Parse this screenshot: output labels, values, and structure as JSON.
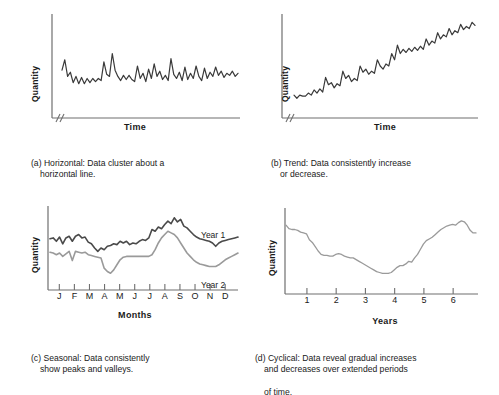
{
  "figure": {
    "background": "#ffffff",
    "ink_color": "#3a3a3a",
    "light_series_color": "#9a9a9a"
  },
  "panels": [
    {
      "key": "a",
      "tag": "(a)",
      "caption_line1": "(a) Horizontal: Data cluster about a",
      "caption_line2": "horizontal line.",
      "ylabel": "Quantity",
      "xlabel": "Time",
      "axis_break": true,
      "ticks": [],
      "series_labels": []
    },
    {
      "key": "b",
      "tag": "(b)",
      "caption_line1": "(b) Trend: Data consistently increase",
      "caption_line2": "or decrease.",
      "ylabel": "Quantity",
      "xlabel": "Time",
      "axis_break": true,
      "ticks": [],
      "series_labels": []
    },
    {
      "key": "c",
      "tag": "(c)",
      "caption_line1": "(c) Seasonal: Data consistently",
      "caption_line2": "show peaks and valleys.",
      "ylabel": "Quantity",
      "xlabel": "Months",
      "axis_break": false,
      "ticks": [
        "J",
        "F",
        "M",
        "A",
        "M",
        "J",
        "J",
        "A",
        "S",
        "O",
        "N",
        "D"
      ],
      "series_labels": [
        "Year 1",
        "Year 2"
      ]
    },
    {
      "key": "d",
      "tag": "(d)",
      "caption_line1": "(d) Cyclical: Data reveal gradual increases",
      "caption_line2": "and decreases over extended periods",
      "caption_line3": "of time.",
      "ylabel": "Quantity",
      "xlabel": "Years",
      "axis_break": false,
      "ticks": [
        "1",
        "2",
        "3",
        "4",
        "5",
        "6"
      ],
      "series_labels": []
    }
  ],
  "chart_data": [
    {
      "id": "a",
      "type": "line",
      "title": "(a) Horizontal: Data cluster about a horizontal line.",
      "xlabel": "Time",
      "ylabel": "Quantity",
      "xlim": [
        0,
        1
      ],
      "ylim": [
        0,
        1
      ],
      "grid": false,
      "legend": "none",
      "axis_break_x": true,
      "tick_labels_x": [],
      "tick_labels_y": [],
      "series": [
        {
          "name": "Horizontal data",
          "color": "#3a3a3a",
          "values": [
            0.46,
            0.56,
            0.4,
            0.44,
            0.34,
            0.4,
            0.33,
            0.39,
            0.33,
            0.38,
            0.34,
            0.38,
            0.35,
            0.38,
            0.36,
            0.54,
            0.42,
            0.4,
            0.62,
            0.46,
            0.4,
            0.36,
            0.41,
            0.37,
            0.41,
            0.37,
            0.35,
            0.5,
            0.38,
            0.43,
            0.35,
            0.47,
            0.38,
            0.52,
            0.4,
            0.45,
            0.37,
            0.41,
            0.36,
            0.57,
            0.42,
            0.38,
            0.44,
            0.36,
            0.49,
            0.37,
            0.43,
            0.38,
            0.5,
            0.4,
            0.36,
            0.48,
            0.38,
            0.44,
            0.4,
            0.49,
            0.41,
            0.45,
            0.39,
            0.43,
            0.41,
            0.45,
            0.4,
            0.43
          ]
        }
      ]
    },
    {
      "id": "b",
      "type": "line",
      "title": "(b) Trend: Data consistently increase or decrease.",
      "xlabel": "Time",
      "ylabel": "Quantity",
      "xlim": [
        0,
        1
      ],
      "ylim": [
        0,
        1
      ],
      "grid": false,
      "legend": "none",
      "axis_break_x": true,
      "tick_labels_x": [],
      "tick_labels_y": [],
      "series": [
        {
          "name": "Trend data",
          "color": "#3a3a3a",
          "values": [
            0.22,
            0.19,
            0.22,
            0.21,
            0.21,
            0.24,
            0.22,
            0.27,
            0.24,
            0.28,
            0.25,
            0.39,
            0.32,
            0.34,
            0.29,
            0.33,
            0.31,
            0.45,
            0.38,
            0.41,
            0.35,
            0.38,
            0.36,
            0.5,
            0.44,
            0.47,
            0.42,
            0.45,
            0.43,
            0.56,
            0.5,
            0.47,
            0.52,
            0.5,
            0.62,
            0.56,
            0.7,
            0.62,
            0.66,
            0.63,
            0.67,
            0.64,
            0.68,
            0.65,
            0.69,
            0.66,
            0.76,
            0.7,
            0.74,
            0.72,
            0.82,
            0.76,
            0.8,
            0.78,
            0.86,
            0.8,
            0.84,
            0.82,
            0.9,
            0.85,
            0.88,
            0.86,
            0.92,
            0.89
          ]
        }
      ]
    },
    {
      "id": "c",
      "type": "line",
      "title": "(c) Seasonal: Data consistently show peaks and valleys.",
      "xlabel": "Months",
      "ylabel": "Quantity",
      "xlim": [
        0,
        12
      ],
      "ylim": [
        0,
        1
      ],
      "grid": false,
      "legend": "inline-right",
      "axis_break_x": false,
      "tick_labels_x": [
        "J",
        "F",
        "M",
        "A",
        "M",
        "J",
        "J",
        "A",
        "S",
        "O",
        "N",
        "D"
      ],
      "tick_labels_y": [],
      "series": [
        {
          "name": "Year 1",
          "color": "#4a4a4a",
          "values": [
            0.61,
            0.62,
            0.58,
            0.63,
            0.55,
            0.62,
            0.64,
            0.58,
            0.64,
            0.66,
            0.62,
            0.63,
            0.57,
            0.55,
            0.5,
            0.46,
            0.5,
            0.48,
            0.52,
            0.53,
            0.55,
            0.54,
            0.58,
            0.56,
            0.58,
            0.54,
            0.56,
            0.55,
            0.58,
            0.6,
            0.59,
            0.62,
            0.72,
            0.7,
            0.75,
            0.73,
            0.78,
            0.82,
            0.79,
            0.86,
            0.81,
            0.84,
            0.76,
            0.74,
            0.7,
            0.66,
            0.63,
            0.61,
            0.6,
            0.59,
            0.58,
            0.56,
            0.52,
            0.56,
            0.58,
            0.59,
            0.6,
            0.61,
            0.62,
            0.63
          ]
        },
        {
          "name": "Year 2",
          "color": "#9a9a9a",
          "values": [
            0.45,
            0.44,
            0.42,
            0.44,
            0.4,
            0.43,
            0.46,
            0.35,
            0.46,
            0.45,
            0.44,
            0.45,
            0.42,
            0.41,
            0.4,
            0.39,
            0.38,
            0.26,
            0.22,
            0.2,
            0.24,
            0.3,
            0.36,
            0.39,
            0.4,
            0.4,
            0.4,
            0.4,
            0.4,
            0.4,
            0.4,
            0.4,
            0.42,
            0.48,
            0.56,
            0.62,
            0.66,
            0.7,
            0.68,
            0.66,
            0.62,
            0.56,
            0.5,
            0.44,
            0.4,
            0.36,
            0.33,
            0.31,
            0.3,
            0.29,
            0.28,
            0.28,
            0.28,
            0.3,
            0.33,
            0.36,
            0.38,
            0.4,
            0.42,
            0.44
          ]
        }
      ]
    },
    {
      "id": "d",
      "type": "line",
      "title": "(d) Cyclical: Data reveal gradual increases and decreases over extended periods of time.",
      "xlabel": "Years",
      "ylabel": "Quantity",
      "xlim": [
        0,
        7
      ],
      "ylim": [
        0,
        1
      ],
      "grid": false,
      "legend": "none",
      "axis_break_x": false,
      "tick_labels_x": [
        "1",
        "2",
        "3",
        "4",
        "5",
        "6"
      ],
      "tick_labels_y": [],
      "series": [
        {
          "name": "Cyclical data",
          "color": "#9a9a9a",
          "values": [
            0.8,
            0.76,
            0.75,
            0.75,
            0.74,
            0.72,
            0.71,
            0.7,
            0.63,
            0.6,
            0.55,
            0.5,
            0.46,
            0.45,
            0.45,
            0.44,
            0.44,
            0.46,
            0.47,
            0.46,
            0.44,
            0.43,
            0.42,
            0.42,
            0.4,
            0.38,
            0.36,
            0.34,
            0.32,
            0.3,
            0.28,
            0.26,
            0.25,
            0.24,
            0.24,
            0.24,
            0.25,
            0.28,
            0.31,
            0.33,
            0.33,
            0.35,
            0.38,
            0.37,
            0.42,
            0.46,
            0.52,
            0.58,
            0.62,
            0.64,
            0.66,
            0.69,
            0.72,
            0.75,
            0.77,
            0.79,
            0.8,
            0.81,
            0.8,
            0.83,
            0.85,
            0.84,
            0.8,
            0.74,
            0.71,
            0.71
          ]
        }
      ]
    }
  ]
}
